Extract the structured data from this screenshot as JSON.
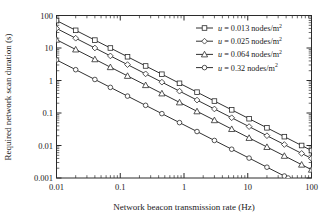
{
  "chart_data": {
    "type": "line",
    "title": "",
    "xlabel": "Network beacon transmission rate (Hz)",
    "ylabel": "Required network scan duration (s)",
    "xscale": "log",
    "yscale": "log",
    "xlim": [
      0.01,
      100
    ],
    "ylim": [
      0.001,
      100
    ],
    "xticks": [
      "0.01",
      "0.1",
      "1",
      "10",
      "100"
    ],
    "xtick_values": [
      0.01,
      0.1,
      1,
      10,
      100
    ],
    "yticks": [
      "0.001",
      "0.01",
      "0.1",
      "1",
      "10",
      "100"
    ],
    "ytick_values": [
      0.001,
      0.01,
      0.1,
      1,
      10,
      100
    ],
    "grid": false,
    "minor_ticks": true,
    "tick_direction": "in",
    "frame": true,
    "legend_position": "upper right",
    "series": [
      {
        "name": "u = 0.013 nodes/m2",
        "label_var": "u",
        "label_value": "0.013",
        "label_unit": "nodes/m",
        "label_exp": "2",
        "marker": "square",
        "color": "#1a1a1a",
        "x": [
          0.01,
          0.02,
          0.04,
          0.07,
          0.13,
          0.25,
          0.45,
          0.85,
          1.6,
          3.0,
          5.6,
          10.5,
          20.0,
          37.5,
          70.0,
          100.0
        ],
        "y": [
          70.0,
          35.0,
          17.5,
          10.0,
          5.38,
          2.8,
          1.56,
          0.82,
          0.438,
          0.233,
          0.125,
          0.0667,
          0.035,
          0.0187,
          0.01,
          0.007
        ]
      },
      {
        "name": "u = 0.025 nodes/m2",
        "label_var": "u",
        "label_value": "0.025",
        "label_unit": "nodes/m",
        "label_exp": "2",
        "marker": "diamond",
        "color": "#1a1a1a",
        "x": [
          0.01,
          0.02,
          0.04,
          0.07,
          0.13,
          0.25,
          0.45,
          0.85,
          1.6,
          3.0,
          5.6,
          10.5,
          20.0,
          37.5,
          70.0,
          100.0
        ],
        "y": [
          40.0,
          20.0,
          10.0,
          5.71,
          3.08,
          1.6,
          0.889,
          0.47,
          0.25,
          0.133,
          0.0714,
          0.0381,
          0.02,
          0.0107,
          0.0057,
          0.004
        ]
      },
      {
        "name": "u = 0.064 nodes/m2",
        "label_var": "u",
        "label_value": "0.064",
        "label_unit": "nodes/m",
        "label_exp": "2",
        "marker": "triangle",
        "color": "#1a1a1a",
        "x": [
          0.01,
          0.02,
          0.04,
          0.07,
          0.13,
          0.25,
          0.45,
          0.85,
          1.6,
          3.0,
          5.6,
          10.5,
          20.0,
          37.5,
          70.0,
          100.0
        ],
        "y": [
          18.0,
          9.0,
          4.5,
          2.57,
          1.385,
          0.72,
          0.4,
          0.212,
          0.1125,
          0.06,
          0.0321,
          0.0171,
          0.009,
          0.0048,
          0.00257,
          0.0018
        ]
      },
      {
        "name": "u = 0.32 nodes/m2",
        "label_var": "u",
        "label_value": "0.32",
        "label_unit": "nodes/m",
        "label_exp": "2",
        "marker": "circle",
        "color": "#1a1a1a",
        "x": [
          0.01,
          0.02,
          0.04,
          0.07,
          0.13,
          0.25,
          0.45,
          0.85,
          1.6,
          3.0,
          5.6,
          10.5,
          20.0,
          37.5,
          43.0
        ],
        "y": [
          4.3,
          2.15,
          1.075,
          0.614,
          0.331,
          0.172,
          0.0956,
          0.0506,
          0.0269,
          0.0143,
          0.00768,
          0.0041,
          0.00215,
          0.00115,
          0.001
        ]
      }
    ]
  },
  "axes": {
    "xlabel": "Network beacon transmission rate (Hz)",
    "ylabel": "Required network scan duration (s)"
  }
}
